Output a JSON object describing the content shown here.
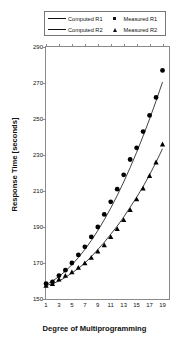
{
  "chart_data": {
    "type": "line",
    "title": "",
    "xlabel": "Degree of Multiprogramming",
    "ylabel": "Response Time [seconds]",
    "xlim": [
      1,
      20
    ],
    "ylim": [
      150,
      290
    ],
    "xticks": [
      1,
      3,
      5,
      7,
      9,
      11,
      13,
      15,
      17,
      19
    ],
    "yticks": [
      150,
      170,
      190,
      210,
      230,
      250,
      270,
      290
    ],
    "grid": false,
    "legend_position": "top-center",
    "x": [
      1,
      2,
      3,
      4,
      5,
      6,
      7,
      8,
      9,
      10,
      11,
      12,
      13,
      14,
      15,
      16,
      17,
      18,
      19
    ],
    "series": [
      {
        "name": "Computed R1",
        "kind": "line",
        "values": [
          158,
          160,
          162.5,
          165.5,
          169,
          173,
          177.5,
          182.5,
          188,
          194,
          200.5,
          207.5,
          215,
          223,
          231.5,
          240.5,
          250,
          260,
          270.5
        ]
      },
      {
        "name": "Measured R1",
        "kind": "marker",
        "marker": "circle",
        "values": [
          158.5,
          159.5,
          163,
          166,
          170,
          174.5,
          179,
          184.5,
          190,
          197,
          204,
          211,
          219,
          227.5,
          234,
          243,
          252,
          262,
          277
        ]
      },
      {
        "name": "Computed R2",
        "kind": "line",
        "values": [
          157.5,
          158.5,
          160,
          162,
          164.5,
          167,
          170,
          173.5,
          177.5,
          181.5,
          186,
          190.5,
          195.5,
          201,
          206.5,
          212.5,
          219,
          226,
          233.5
        ]
      },
      {
        "name": "Measured R2",
        "kind": "marker",
        "marker": "triangle",
        "values": [
          157.5,
          158.5,
          161,
          163,
          165,
          167.5,
          170,
          173,
          176.5,
          180,
          184.5,
          189,
          194,
          199.5,
          205.5,
          211.5,
          218.5,
          226,
          236
        ]
      }
    ]
  },
  "legend": {
    "computed_r1": "Computed R1",
    "measured_r1": "Measured R1",
    "computed_r2": "Computed R2",
    "measured_r2": "Measured R2"
  },
  "axes": {
    "x_title": "Degree of Multiprogramming",
    "y_title": "Response Time [seconds]"
  },
  "colors": {
    "line": "#111111",
    "marker": "#000000",
    "frame": "#8a8a8a",
    "background": "#ffffff"
  }
}
